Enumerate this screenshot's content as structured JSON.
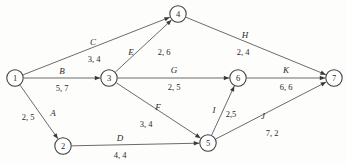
{
  "diagram": {
    "type": "directed-network",
    "canvas": {
      "width": 347,
      "height": 165
    },
    "node_radius": 8.2,
    "colors": {
      "background": "#fdfdfc",
      "edge_stroke": "#5a5a5a",
      "node_stroke": "#3a3a3a",
      "node_fill": "#ffffff",
      "text": "#2b2b2b"
    },
    "nodes": [
      {
        "id": "1",
        "label": "1",
        "x": 15,
        "y": 78
      },
      {
        "id": "2",
        "label": "2",
        "x": 63,
        "y": 146
      },
      {
        "id": "3",
        "label": "3",
        "x": 109,
        "y": 78
      },
      {
        "id": "4",
        "label": "4",
        "x": 178,
        "y": 14
      },
      {
        "id": "5",
        "label": "5",
        "x": 208,
        "y": 143
      },
      {
        "id": "6",
        "label": "6",
        "x": 238,
        "y": 78
      },
      {
        "id": "7",
        "label": "7",
        "x": 334,
        "y": 78
      }
    ],
    "edges": [
      {
        "id": "A",
        "name": "A",
        "weight": "2, 5",
        "from": "1",
        "to": "2",
        "name_x": 53,
        "name_y": 113,
        "weight_x": 28,
        "weight_y": 117
      },
      {
        "id": "B",
        "name": "B",
        "weight": "5, 7",
        "from": "1",
        "to": "3",
        "name_x": 62,
        "name_y": 71,
        "weight_x": 62,
        "weight_y": 88
      },
      {
        "id": "C",
        "name": "C",
        "weight": "3, 4",
        "from": "1",
        "to": "4",
        "name_x": 93,
        "name_y": 42,
        "weight_x": 94,
        "weight_y": 59
      },
      {
        "id": "D",
        "name": "D",
        "weight": "4, 4",
        "from": "2",
        "to": "5",
        "name_x": 120,
        "name_y": 138,
        "weight_x": 120,
        "weight_y": 155
      },
      {
        "id": "E",
        "name": "E",
        "weight": "2, 6",
        "from": "3",
        "to": "4",
        "name_x": 131,
        "name_y": 52,
        "weight_x": 164,
        "weight_y": 52
      },
      {
        "id": "F",
        "name": "F",
        "weight": "3, 4",
        "from": "3",
        "to": "5",
        "name_x": 158,
        "name_y": 107,
        "weight_x": 146,
        "weight_y": 124
      },
      {
        "id": "G",
        "name": "G",
        "weight": "2, 5",
        "from": "3",
        "to": "6",
        "name_x": 174,
        "name_y": 70,
        "weight_x": 174,
        "weight_y": 87
      },
      {
        "id": "H",
        "name": "H",
        "weight": "2, 4",
        "from": "4",
        "to": "7",
        "name_x": 245,
        "name_y": 35,
        "weight_x": 243,
        "weight_y": 52
      },
      {
        "id": "I",
        "name": "I",
        "weight": "2,5",
        "from": "5",
        "to": "6",
        "name_x": 214,
        "name_y": 110,
        "weight_x": 231,
        "weight_y": 114
      },
      {
        "id": "J",
        "name": "J",
        "weight": "7, 2",
        "from": "5",
        "to": "7",
        "name_x": 263,
        "name_y": 116,
        "weight_x": 272,
        "weight_y": 133
      },
      {
        "id": "K",
        "name": "K",
        "weight": "6, 6",
        "from": "6",
        "to": "7",
        "name_x": 286,
        "name_y": 70,
        "weight_x": 286,
        "weight_y": 87
      }
    ]
  }
}
